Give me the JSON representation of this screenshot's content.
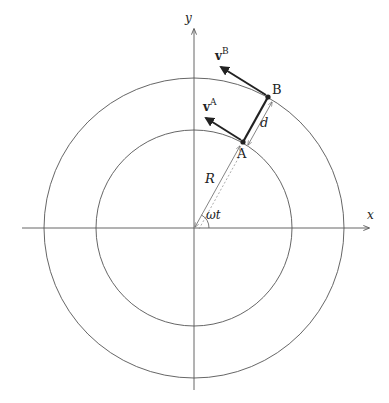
{
  "diagram": {
    "type": "rotating-frame-geometry",
    "colors": {
      "line": "#555555",
      "thick": "#222222",
      "background": "#ffffff"
    },
    "origin": {
      "x": 194,
      "y": 228
    },
    "axes": {
      "x": {
        "label": "x",
        "from": 22,
        "to": 370
      },
      "y": {
        "label": "y",
        "from": 390,
        "to": 28
      }
    },
    "circles": {
      "inner_radius": 98,
      "outer_radius": 150
    },
    "angle_deg": 60,
    "points": {
      "A": {
        "label": "A"
      },
      "B": {
        "label": "B"
      }
    },
    "labels": {
      "R": "R",
      "d": "d",
      "omega_t": "ωt",
      "vA_base": "v",
      "vA_sup": "A",
      "vB_base": "v",
      "vB_sup": "B"
    }
  }
}
